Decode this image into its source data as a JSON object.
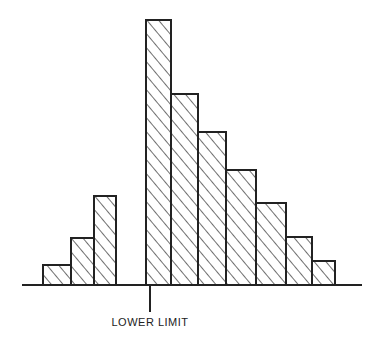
{
  "chart_data": {
    "type": "bar",
    "title": "",
    "xlabel": "",
    "ylabel": "",
    "annotation": "LOWER LIMIT",
    "grid": false,
    "legend": null,
    "hatch": "diagonal",
    "bar_color": "#ffffff",
    "line_color": "#222222",
    "baseline": {
      "x1": 22,
      "x2": 362,
      "y": 285
    },
    "lower_limit_marker": {
      "x": 150,
      "y1": 285,
      "y2": 312
    },
    "groups": [
      {
        "name": "below-limit",
        "bars": [
          {
            "x": 43,
            "w": 28,
            "value": 20
          },
          {
            "x": 71,
            "w": 23,
            "value": 47
          },
          {
            "x": 94,
            "w": 22,
            "value": 89
          }
        ]
      },
      {
        "name": "above-limit",
        "bars": [
          {
            "x": 146,
            "w": 25,
            "value": 265
          },
          {
            "x": 171,
            "w": 27,
            "value": 191
          },
          {
            "x": 198,
            "w": 28,
            "value": 153
          },
          {
            "x": 226,
            "w": 30,
            "value": 115
          },
          {
            "x": 256,
            "w": 30,
            "value": 82
          },
          {
            "x": 286,
            "w": 26,
            "value": 48
          },
          {
            "x": 312,
            "w": 23,
            "value": 24
          }
        ]
      }
    ],
    "values": [
      20,
      47,
      89,
      265,
      191,
      153,
      115,
      82,
      48,
      24
    ]
  },
  "label": "LOWER LIMIT"
}
